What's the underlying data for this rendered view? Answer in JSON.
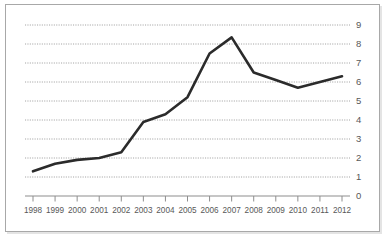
{
  "chart_data": {
    "type": "line",
    "title": "",
    "subtitle": "",
    "xlabel": "",
    "ylabel": "",
    "categories": [
      "1998",
      "1999",
      "2000",
      "2001",
      "2002",
      "2003",
      "2004",
      "2005",
      "2006",
      "2007",
      "2008",
      "2009",
      "2010",
      "2011",
      "2012"
    ],
    "x": [
      1998,
      1999,
      2000,
      2001,
      2002,
      2003,
      2004,
      2005,
      2006,
      2007,
      2008,
      2009,
      2010,
      2011,
      2012
    ],
    "values": [
      1.3,
      1.7,
      1.9,
      2.0,
      2.3,
      3.9,
      4.3,
      5.2,
      7.5,
      8.35,
      6.5,
      6.1,
      5.7,
      6.0,
      6.3
    ],
    "series": [
      {
        "name": "series-1",
        "color": "#2b2b2b",
        "values": [
          1.3,
          1.7,
          1.9,
          2.0,
          2.3,
          3.9,
          4.3,
          5.2,
          7.5,
          8.35,
          6.5,
          6.1,
          5.7,
          6.0,
          6.3
        ]
      }
    ],
    "ylim": [
      0,
      9
    ],
    "xlim": [
      1998,
      2012
    ],
    "ytick_labels": [
      "0",
      "1",
      "2",
      "3",
      "4",
      "5",
      "6",
      "7",
      "8",
      "9"
    ],
    "ytick_values": [
      0,
      1,
      2,
      3,
      4,
      5,
      6,
      7,
      8,
      9
    ],
    "xtick_labels": [
      "1998",
      "1999",
      "2000",
      "2001",
      "2002",
      "2003",
      "2004",
      "2005",
      "2006",
      "2007",
      "2008",
      "2009",
      "2010",
      "2011",
      "2012"
    ],
    "grid": true,
    "grid_style": "dotted-horizontal",
    "grid_color": "#9a9a9a",
    "y_axis_position": "right",
    "legend": false,
    "legend_position": "none",
    "annotations": [],
    "axis_color": "#8e8e8e",
    "background_color": "#ffffff",
    "border_color": "#a8a8a8"
  }
}
